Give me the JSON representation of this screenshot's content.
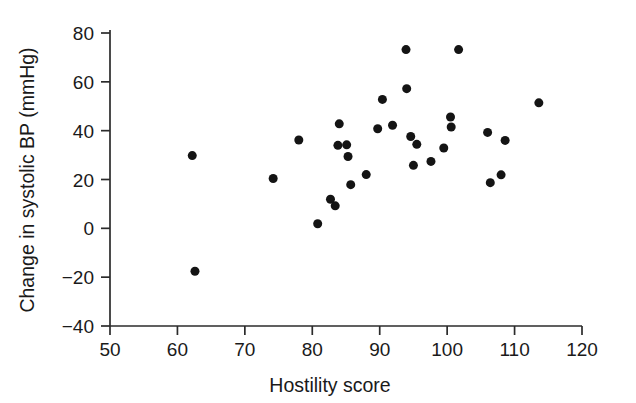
{
  "chart_data": {
    "type": "scatter",
    "title": "",
    "xlabel": "Hostility score",
    "ylabel": "Change in systolic BP (mmHg)",
    "xlim": [
      50,
      120
    ],
    "ylim": [
      -40,
      80
    ],
    "xticks": [
      50,
      60,
      70,
      80,
      90,
      100,
      110,
      120
    ],
    "yticks": [
      80,
      60,
      40,
      20,
      0,
      -20,
      -40
    ],
    "xtick_labels": [
      "50",
      "60",
      "70",
      "80",
      "90",
      "100",
      "110",
      "120"
    ],
    "ytick_labels": [
      "80",
      "60",
      "40",
      "20",
      "0",
      "−20",
      "−40"
    ],
    "grid": false,
    "legend": null,
    "marker": {
      "shape": "circle",
      "color": "#141414",
      "size": 9
    },
    "n_points": 35,
    "points": [
      {
        "x": 62.2,
        "y": 29.8
      },
      {
        "x": 62.6,
        "y": -17.6
      },
      {
        "x": 74.2,
        "y": 20.4
      },
      {
        "x": 78.0,
        "y": 36.2
      },
      {
        "x": 80.8,
        "y": 1.9
      },
      {
        "x": 82.7,
        "y": 11.9
      },
      {
        "x": 83.4,
        "y": 9.2
      },
      {
        "x": 83.8,
        "y": 34.0
      },
      {
        "x": 84.0,
        "y": 42.8
      },
      {
        "x": 85.1,
        "y": 34.2
      },
      {
        "x": 85.3,
        "y": 29.4
      },
      {
        "x": 85.7,
        "y": 17.9
      },
      {
        "x": 88.0,
        "y": 22.0
      },
      {
        "x": 89.7,
        "y": 40.8
      },
      {
        "x": 90.4,
        "y": 52.8
      },
      {
        "x": 91.9,
        "y": 42.2
      },
      {
        "x": 93.9,
        "y": 73.2
      },
      {
        "x": 94.0,
        "y": 57.2
      },
      {
        "x": 94.6,
        "y": 37.6
      },
      {
        "x": 95.0,
        "y": 25.8
      },
      {
        "x": 95.5,
        "y": 34.4
      },
      {
        "x": 97.6,
        "y": 27.4
      },
      {
        "x": 99.5,
        "y": 32.9
      },
      {
        "x": 100.5,
        "y": 45.6
      },
      {
        "x": 100.6,
        "y": 41.5
      },
      {
        "x": 101.7,
        "y": 73.2
      },
      {
        "x": 106.0,
        "y": 39.3
      },
      {
        "x": 106.4,
        "y": 18.7
      },
      {
        "x": 108.0,
        "y": 21.9
      },
      {
        "x": 108.6,
        "y": 36.0
      },
      {
        "x": 113.6,
        "y": 51.4
      }
    ]
  },
  "figure": {
    "background_color": "#ffffff",
    "axis_color": "#2b2b2b",
    "text_color": "#1a1a1a"
  }
}
